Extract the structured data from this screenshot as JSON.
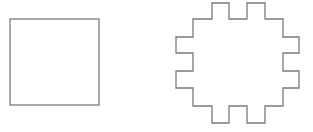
{
  "canvas": {
    "width": 313,
    "height": 132,
    "background": "#ffffff"
  },
  "stroke_color": "#7a7a7a",
  "shapes": [
    {
      "name": "square",
      "type": "rect",
      "x": 10,
      "y": 19,
      "width": 89,
      "height": 86
    },
    {
      "name": "notched-octagon",
      "type": "polygon",
      "points": "212,3 229,3 229,19 247,19 247,3 265,3 265,19 283,19 283,37 299,37 299,53 283,53 283,71 299,71 299,88 283,88 283,106 265,106 265,123 247,123 247,106 229,106 229,123 212,123 212,106 193,106 193,88 176,88 176,71 193,71 193,53 176,53 176,37 193,37 193,19 212,19"
    }
  ]
}
